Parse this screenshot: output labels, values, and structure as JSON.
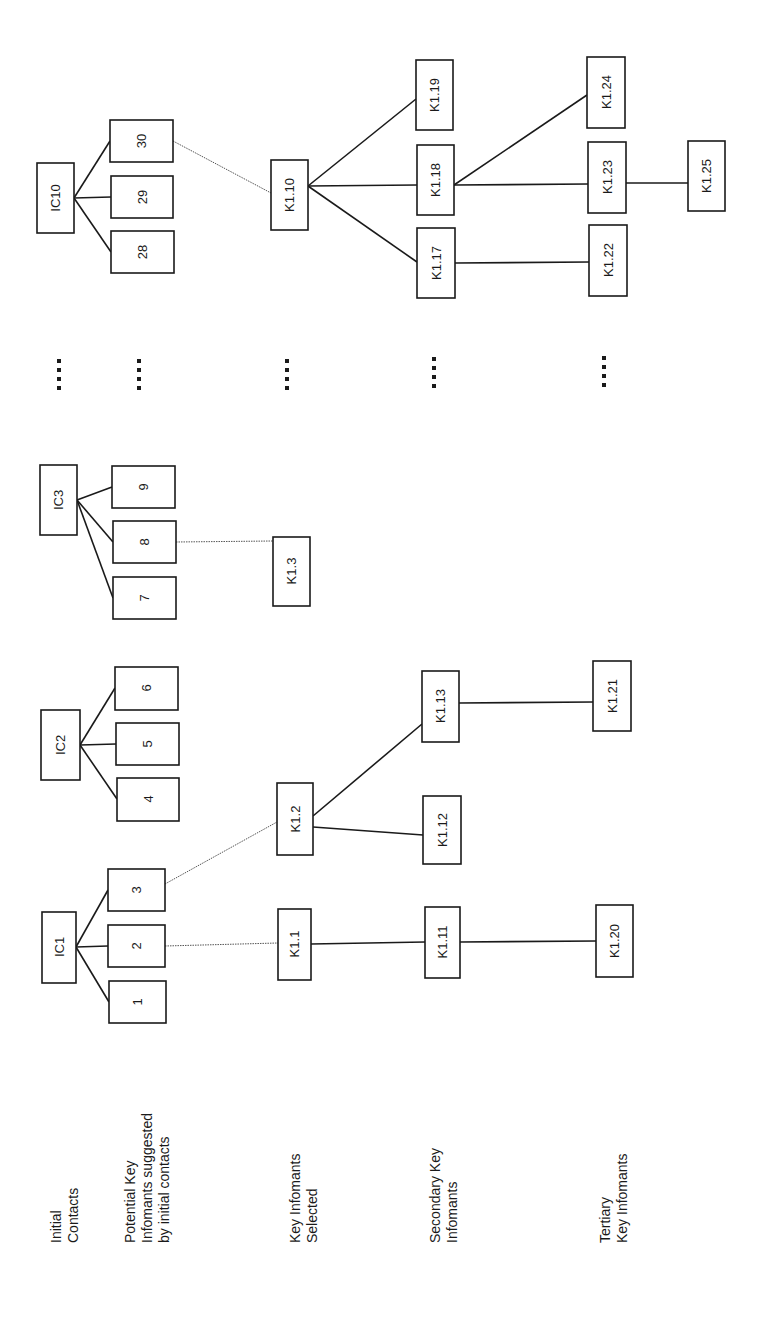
{
  "orientation": "rotated-90-ccw",
  "row_labels": [
    {
      "id": "initial-contacts",
      "lines": [
        "Initial",
        "Contacts"
      ]
    },
    {
      "id": "potential-key-informants",
      "lines": [
        "Potential Key",
        "Infomants suggested",
        "by initial contacts"
      ]
    },
    {
      "id": "key-informants-selected",
      "lines": [
        "Key Infomants",
        "Selected"
      ]
    },
    {
      "id": "secondary-key-informants",
      "lines": [
        "Secondary Key",
        "Infomants"
      ]
    },
    {
      "id": "tertiary-key-informants",
      "lines": [
        "Tertiary",
        "Key Infomants"
      ]
    }
  ],
  "nodes": {
    "IC1": "IC1",
    "IC2": "IC2",
    "IC3": "IC3",
    "IC10": "IC10",
    "n1": "1",
    "n2": "2",
    "n3": "3",
    "n4": "4",
    "n5": "5",
    "n6": "6",
    "n7": "7",
    "n8": "8",
    "n9": "9",
    "n28": "28",
    "n29": "29",
    "n30": "30",
    "K1_1": "K1.1",
    "K1_2": "K1.2",
    "K1_3": "K1.3",
    "K1_10": "K1.10",
    "K1_11": "K1.11",
    "K1_12": "K1.12",
    "K1_13": "K1.13",
    "K1_17": "K1.17",
    "K1_18": "K1.18",
    "K1_19": "K1.19",
    "K1_20": "K1.20",
    "K1_21": "K1.21",
    "K1_22": "K1.22",
    "K1_23": "K1.23",
    "K1_24": "K1.24",
    "K1_25": "K1.25"
  },
  "edges": {
    "solid": [
      [
        "IC1",
        "1"
      ],
      [
        "IC1",
        "2"
      ],
      [
        "IC1",
        "3"
      ],
      [
        "IC2",
        "4"
      ],
      [
        "IC2",
        "5"
      ],
      [
        "IC2",
        "6"
      ],
      [
        "IC3",
        "7"
      ],
      [
        "IC3",
        "8"
      ],
      [
        "IC3",
        "9"
      ],
      [
        "IC10",
        "28"
      ],
      [
        "IC10",
        "29"
      ],
      [
        "IC10",
        "30"
      ],
      [
        "K1.1",
        "K1.11"
      ],
      [
        "K1.11",
        "K1.20"
      ],
      [
        "K1.2",
        "K1.12"
      ],
      [
        "K1.2",
        "K1.13"
      ],
      [
        "K1.13",
        "K1.21"
      ],
      [
        "K1.10",
        "K1.17"
      ],
      [
        "K1.10",
        "K1.18"
      ],
      [
        "K1.10",
        "K1.19"
      ],
      [
        "K1.17",
        "K1.22"
      ],
      [
        "K1.18",
        "K1.23"
      ],
      [
        "K1.18",
        "K1.24"
      ],
      [
        "K1.23",
        "K1.25"
      ]
    ],
    "dotted": [
      [
        "2",
        "K1.1"
      ],
      [
        "3",
        "K1.2"
      ],
      [
        "8",
        "K1.3"
      ],
      [
        "30",
        "K1.10"
      ]
    ]
  },
  "ellipsis": "...."
}
